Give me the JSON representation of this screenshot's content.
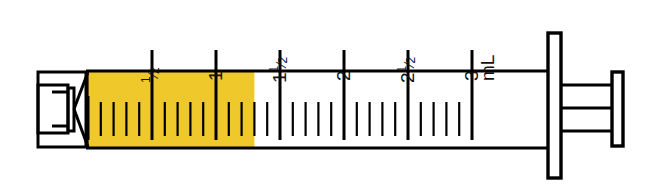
{
  "figure": {
    "kind": "syringe-illustration",
    "unit_label": "mL",
    "fill_color": "#EFC92B",
    "outline_color": "#000000",
    "background_color": "#FFFFFF"
  },
  "scale": {
    "unit": "mL",
    "min": 0,
    "max": 3,
    "major_step": 0.5,
    "minor_step": 0.1,
    "labels": [
      {
        "value": 0.5,
        "text": "1/2",
        "num": "1",
        "den": "2",
        "whole": ""
      },
      {
        "value": 1.0,
        "text": "1",
        "num": "",
        "den": "",
        "whole": "1"
      },
      {
        "value": 1.5,
        "text": "11/2",
        "num": "1",
        "den": "2",
        "whole": "1"
      },
      {
        "value": 2.0,
        "text": "2",
        "num": "",
        "den": "",
        "whole": "2"
      },
      {
        "value": 2.5,
        "text": "21/2",
        "num": "1",
        "den": "2",
        "whole": "2"
      },
      {
        "value": 3.0,
        "text": "3",
        "num": "",
        "den": "",
        "whole": "3"
      }
    ]
  },
  "dose": {
    "filled_volume": 1.3,
    "filled_volume_text": "1.3 mL",
    "fill_start": 0,
    "fill_end": 1.3
  },
  "parts": {
    "tip": "luer-tip",
    "barrel": "barrel",
    "plunger_flange": "plunger-flange",
    "thumb_rest": "thumb-rest",
    "finger_flange": "finger-flange"
  }
}
